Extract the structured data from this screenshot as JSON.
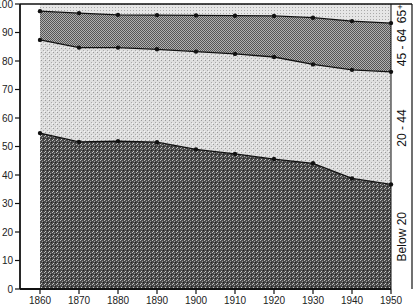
{
  "chart_data": {
    "type": "area",
    "stacked": true,
    "title": "",
    "xlabel": "",
    "ylabel": "",
    "x": [
      1860,
      1870,
      1880,
      1890,
      1900,
      1910,
      1920,
      1930,
      1940,
      1950
    ],
    "xlim": [
      1860,
      1950
    ],
    "ylim": [
      0,
      100
    ],
    "yticks": [
      0,
      10,
      20,
      30,
      40,
      50,
      60,
      70,
      80,
      90,
      100
    ],
    "grid": false,
    "legend_position": "right (rotated band labels)",
    "cumulative_boundaries": {
      "below_20_top": [
        54.7,
        51.6,
        51.9,
        51.5,
        49.0,
        47.4,
        45.6,
        44.1,
        38.8,
        36.7
      ],
      "age_20_44_top": [
        87.4,
        84.7,
        84.7,
        84.1,
        83.3,
        82.5,
        81.4,
        78.8,
        76.9,
        76.2
      ],
      "age_45_64_top": [
        97.5,
        96.8,
        96.2,
        96.1,
        96.0,
        95.9,
        95.8,
        95.2,
        94.0,
        93.3
      ]
    },
    "series": [
      {
        "name": "Below 20",
        "values": [
          54.7,
          51.6,
          51.9,
          51.5,
          49.0,
          47.4,
          45.6,
          44.1,
          38.8,
          36.7
        ]
      },
      {
        "name": "20 - 44",
        "values": [
          32.7,
          33.1,
          32.8,
          32.6,
          34.3,
          35.1,
          35.8,
          34.7,
          38.1,
          39.5
        ]
      },
      {
        "name": "45 - 64",
        "values": [
          10.1,
          12.1,
          11.5,
          12.0,
          12.7,
          13.4,
          14.4,
          16.4,
          17.1,
          17.1
        ]
      },
      {
        "name": "65+",
        "values": [
          2.5,
          3.2,
          3.8,
          3.9,
          4.0,
          4.1,
          4.2,
          4.8,
          6.0,
          6.7
        ]
      }
    ],
    "band_labels": [
      "Below 20",
      "20 - 44",
      "45 - 64",
      "65⁺"
    ]
  },
  "axis": {
    "y_tick_labels": [
      "0",
      "10",
      "20",
      "30",
      "40",
      "50",
      "60",
      "70",
      "80",
      "90",
      "100"
    ],
    "x_tick_labels": [
      "1860",
      "1870",
      "1880",
      "1890",
      "1900",
      "1910",
      "1920",
      "1930",
      "1940",
      "1950"
    ]
  },
  "colors": {
    "below_20": "#5a5a5a",
    "age_20_44": "#d6d6d6",
    "age_45_64": "#8c8c8c",
    "age_65_plus": "#e2e2e2",
    "line": "#111111"
  }
}
